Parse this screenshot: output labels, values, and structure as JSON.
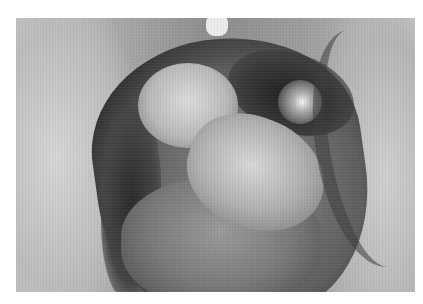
{
  "image": {
    "type": "photograph",
    "colorMode": "grayscale",
    "subject": "clinical close-up of an open tissue cavity with irregular lesion",
    "frame": {
      "left": 16,
      "top": 18,
      "width": 399,
      "height": 274
    },
    "colors": {
      "background": "#ffffff",
      "lightTissue": "#d6d6d6",
      "midTone": "#8c8c8c",
      "shadow": "#2a2a2a",
      "highlight": "#f5f5f5"
    }
  }
}
